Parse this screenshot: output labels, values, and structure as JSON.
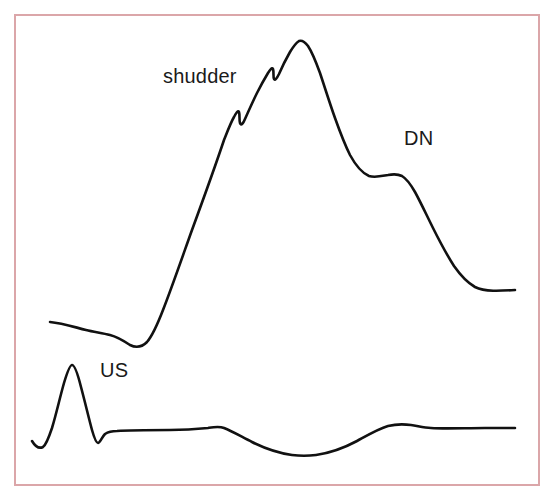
{
  "figure": {
    "kind": "medical-waveform-diagram",
    "background_color": "#ffffff",
    "border_color": "#dba6a9",
    "trace_color": "#111111"
  },
  "annotations": {
    "shudder": {
      "label": "shudder",
      "meaning": "anacrotic shudder on the upstroke of the arterial pressure waveform"
    },
    "dn": {
      "label": "DN",
      "meaning": "dicrotic notch"
    },
    "us": {
      "label": "US",
      "meaning": "upstroke"
    }
  },
  "chart_data": {
    "type": "line",
    "title": "",
    "subtitle": "",
    "xlabel": "",
    "ylabel": "",
    "grid": false,
    "legend_position": "none",
    "xlim": [
      0,
      555
    ],
    "ylim": [
      499,
      0
    ],
    "axis_note": "coordinates are pixel positions in the source figure; y increases downward",
    "annotations": [
      {
        "text": "shudder",
        "x": 163,
        "y": 76,
        "target_x": 237,
        "target_y": 112
      },
      {
        "text": "DN",
        "x": 404,
        "y": 139,
        "target_x": 392,
        "target_y": 175
      },
      {
        "text": "US",
        "x": 100,
        "y": 370,
        "target_x": 72,
        "target_y": 368
      }
    ],
    "series": [
      {
        "name": "arterial pressure waveform",
        "stroke": "#111111",
        "path": "M 50 322 C 62 323 74 327 86 330 C 94 332 102 333 110 335 C 118 337 124 341 130 345 C 136 348 142 347 147 342 C 153 335 158 323 163 310 C 172 287 182 258 192 230 C 203 200 214 170 224 140 C 228 130 231 122 234 117 C 236 113 238 110 239 112 C 240 115 239 120 240 123 C 241 126 243 124 245 119 C 249 110 253 101 257 93 C 261 85 265 78 268 73 C 270 70 272 67 273 69 C 274 72 273 77 274 79 C 275 81 277 78 279 74 C 282 67 286 59 290 52 C 293 47 296 43 299 41 C 302 40 305 42 308 46 C 312 52 316 62 320 73 C 325 88 330 104 335 118 C 340 132 345 145 350 155 C 356 166 362 173 369 176 C 375 178 382 176 388 175 C 393 174 398 174 402 176 C 407 179 411 185 415 192 C 421 203 427 216 433 228 C 440 242 447 255 454 266 C 461 276 468 283 475 287 C 485 292 500 291 515 290",
        "points": [
          {
            "x": 50,
            "y": 322,
            "label": "baseline start"
          },
          {
            "x": 110,
            "y": 335,
            "label": "diastolic shelf"
          },
          {
            "x": 130,
            "y": 345,
            "label": "end-diastolic trough"
          },
          {
            "x": 163,
            "y": 310,
            "label": "upstroke onset (US)"
          },
          {
            "x": 237,
            "y": 112,
            "label": "first shudder notch"
          },
          {
            "x": 273,
            "y": 69,
            "label": "second shudder notch"
          },
          {
            "x": 299,
            "y": 41,
            "label": "systolic peak"
          },
          {
            "x": 392,
            "y": 175,
            "label": "dicrotic notch (DN)"
          },
          {
            "x": 515,
            "y": 290,
            "label": "trace end"
          }
        ]
      },
      {
        "name": "ecg trace",
        "stroke": "#111111",
        "path": "M 32 441 C 35 446 39 449 43 447 C 46 445 49 437 52 428 C 56 415 60 397 64 383 C 67 373 70 365 72 365 C 75 365 78 375 81 387 C 85 402 89 419 92 430 C 94 437 96 443 98 443 C 100 443 102 437 105 434 C 108 432 112 431 117 431 C 130 430 150 430 170 430 C 185 430 198 429 208 428 C 214 427 219 426 224 428 C 232 431 242 437 252 442 C 264 448 278 453 292 455 C 300 456 308 456 316 455 C 330 453 344 448 357 441 C 368 435 378 429 388 426 C 396 424 404 424 411 425 C 418 426 424 428 431 428 C 445 429 465 428 485 428 C 497 428 507 428 515 428",
        "points": [
          {
            "x": 32,
            "y": 441,
            "label": "start of trace"
          },
          {
            "x": 43,
            "y": 447,
            "label": "Q dip"
          },
          {
            "x": 72,
            "y": 365,
            "label": "R peak"
          },
          {
            "x": 98,
            "y": 443,
            "label": "S dip"
          },
          {
            "x": 117,
            "y": 431,
            "label": "isoelectric baseline"
          },
          {
            "x": 210,
            "y": 428,
            "label": "small bump"
          },
          {
            "x": 305,
            "y": 455,
            "label": "trough"
          },
          {
            "x": 393,
            "y": 425,
            "label": "T-wave crest"
          },
          {
            "x": 515,
            "y": 428,
            "label": "trace end"
          }
        ]
      }
    ]
  }
}
